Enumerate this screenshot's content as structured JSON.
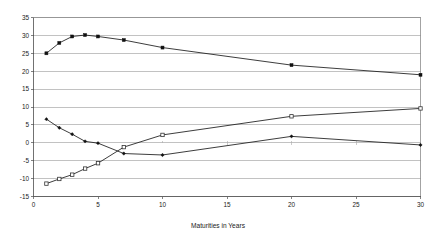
{
  "chart_data": {
    "type": "line",
    "title": "",
    "subtitle": "",
    "xlabel": "Maturities in Years",
    "ylabel": "",
    "x": [
      1,
      2,
      3,
      4,
      5,
      7,
      10,
      20,
      30
    ],
    "xlim": [
      0,
      30
    ],
    "ylim": [
      -15,
      35
    ],
    "xticks": [
      0,
      5,
      10,
      15,
      20,
      25,
      30
    ],
    "yticks": [
      -15,
      -10,
      -5,
      0,
      5,
      10,
      15,
      20,
      25,
      30,
      35
    ],
    "xtick_labels": [
      "0",
      "5",
      "10",
      "15",
      "20",
      "25",
      "30"
    ],
    "ytick_labels": [
      "-15",
      "-10",
      "-5",
      "0",
      "5",
      "10",
      "15",
      "20",
      "25",
      "30",
      "35"
    ],
    "grid": "horizontal",
    "legend": "none",
    "series": [
      {
        "name": "series-1",
        "marker": "filled-square",
        "color": "#111111",
        "values": [
          25.0,
          27.9,
          29.7,
          30.1,
          29.7,
          28.7,
          26.6,
          21.7,
          19.0
        ]
      },
      {
        "name": "series-2",
        "marker": "hollow-square",
        "color": "#333333",
        "values": [
          -11.4,
          -10.1,
          -8.9,
          -7.2,
          -5.7,
          -1.2,
          2.2,
          7.4,
          9.6
        ]
      },
      {
        "name": "series-3",
        "marker": "filled-diamond",
        "color": "#111111",
        "values": [
          6.6,
          4.2,
          2.4,
          0.4,
          -0.1,
          -3.0,
          -3.4,
          1.8,
          -0.6
        ]
      }
    ]
  },
  "axis": {
    "x_title": "Maturities in Years"
  }
}
